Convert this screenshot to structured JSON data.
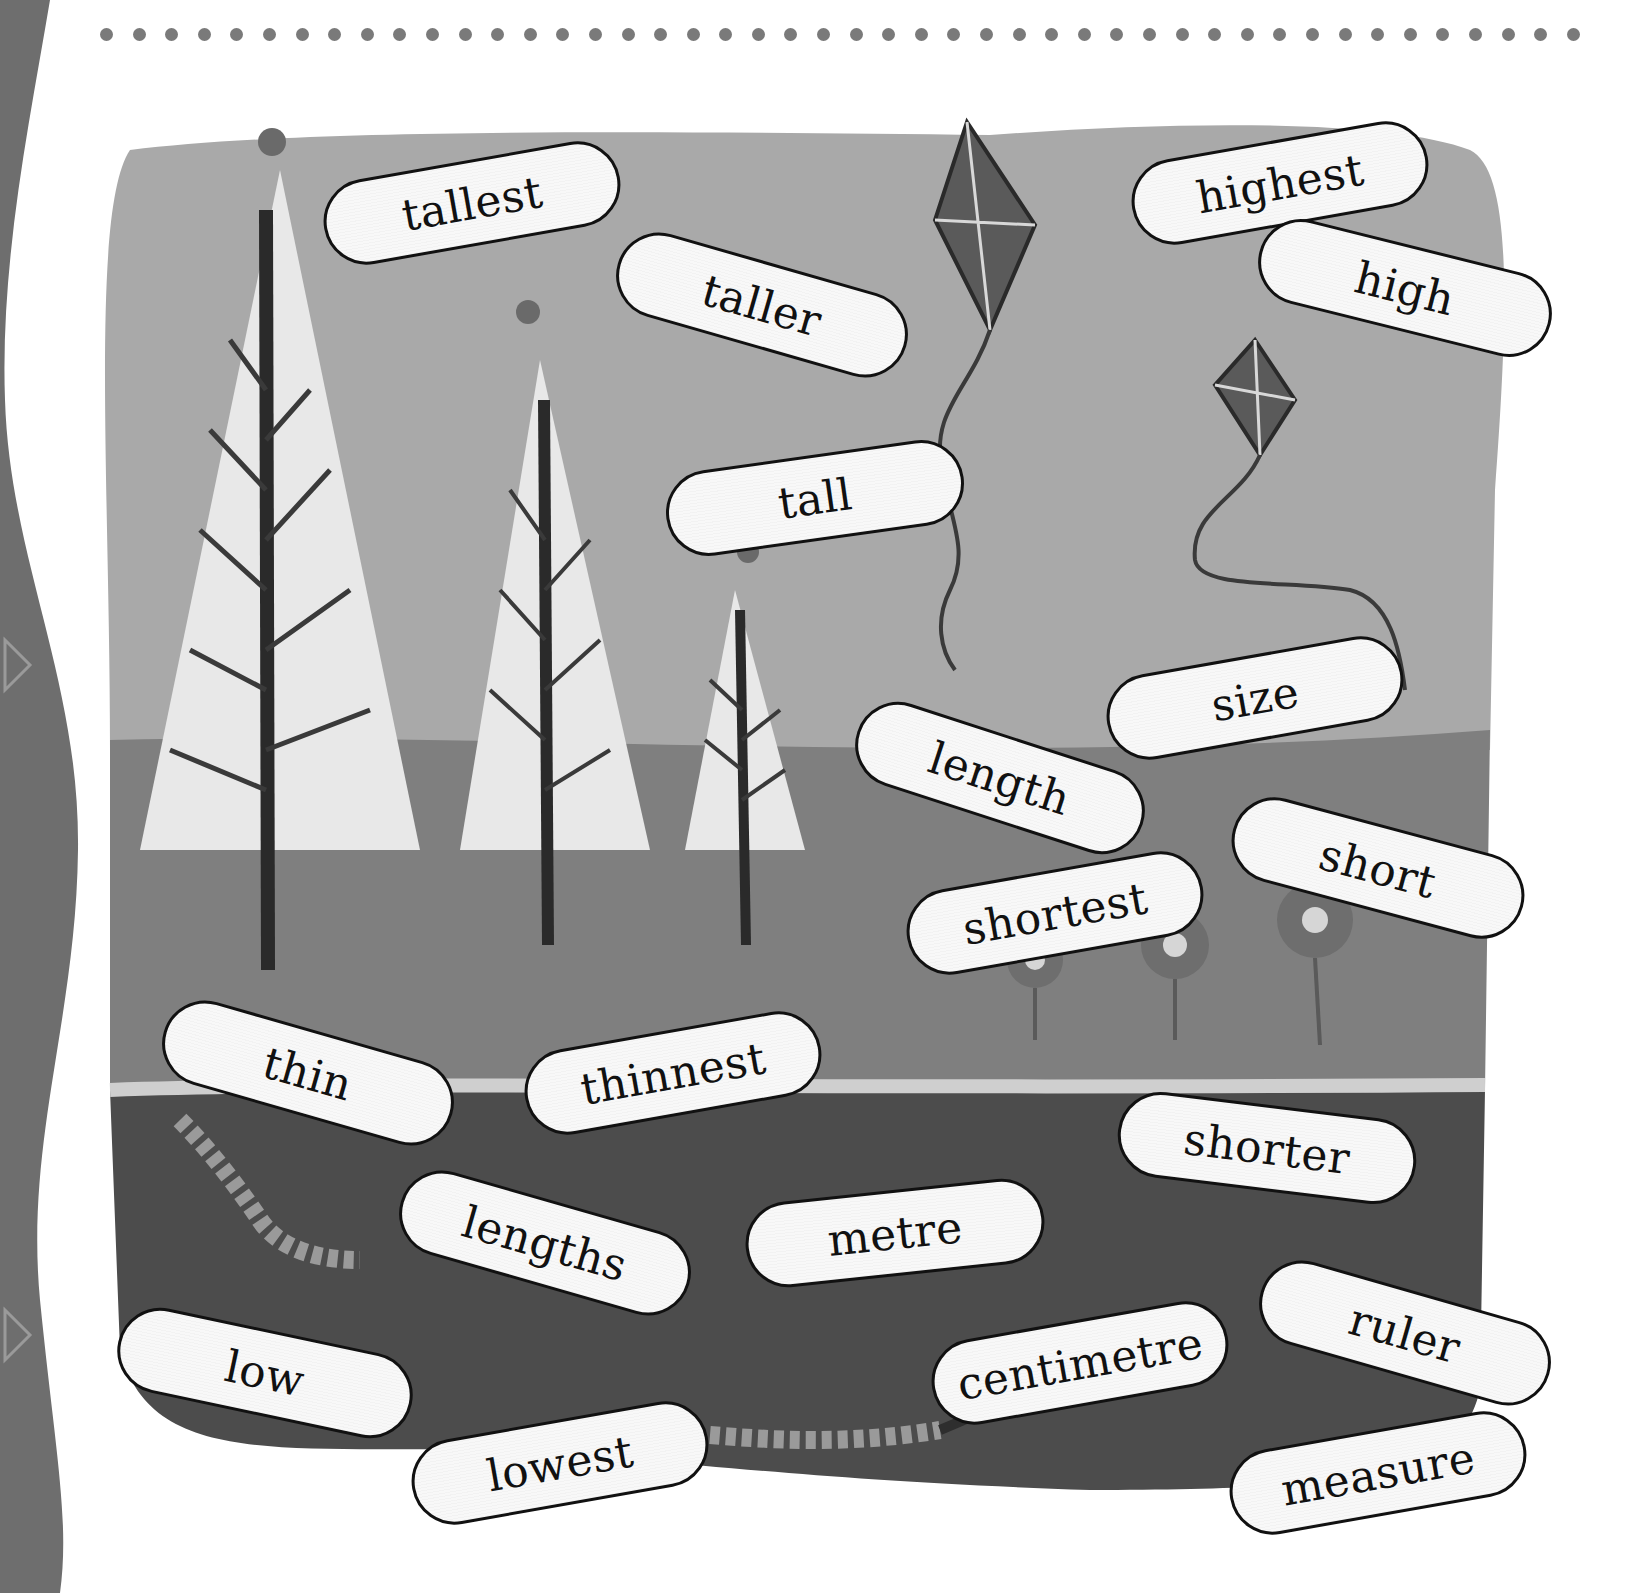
{
  "header": {
    "dot_count": 46,
    "dot_color": "#7a7a7a"
  },
  "scene": {
    "colors": {
      "sky": "#a9a9a9",
      "grass": "#7f7f7f",
      "soil": "#4c4c4c",
      "tree_glow": "#e8e8e8",
      "trunk": "#2a2a2a",
      "kite": "#5a5a5a",
      "border_strip": "#6e6e6e"
    },
    "illustrations": [
      "tall-tree",
      "medium-tree",
      "small-tree",
      "bird",
      "kite-high",
      "kite-low",
      "flowers",
      "worm-upper",
      "worm-lower",
      "ant"
    ]
  },
  "words": [
    {
      "id": "tallest",
      "label": "tallest",
      "x": 322,
      "y": 160,
      "w": 300,
      "rot": -10
    },
    {
      "id": "taller",
      "label": "taller",
      "x": 612,
      "y": 262,
      "w": 300,
      "rot": 16
    },
    {
      "id": "tall",
      "label": "tall",
      "x": 665,
      "y": 455,
      "w": 300,
      "rot": -8
    },
    {
      "id": "highest",
      "label": "highest",
      "x": 1130,
      "y": 140,
      "w": 300,
      "rot": -10
    },
    {
      "id": "high",
      "label": "high",
      "x": 1255,
      "y": 245,
      "w": 300,
      "rot": 14
    },
    {
      "id": "size",
      "label": "size",
      "x": 1105,
      "y": 655,
      "w": 300,
      "rot": -10
    },
    {
      "id": "length",
      "label": "length",
      "x": 850,
      "y": 735,
      "w": 300,
      "rot": 18
    },
    {
      "id": "short",
      "label": "short",
      "x": 1228,
      "y": 825,
      "w": 300,
      "rot": 15
    },
    {
      "id": "shortest",
      "label": "shortest",
      "x": 905,
      "y": 870,
      "w": 300,
      "rot": -10
    },
    {
      "id": "thin",
      "label": "thin",
      "x": 158,
      "y": 1030,
      "w": 300,
      "rot": 16
    },
    {
      "id": "thinnest",
      "label": "thinnest",
      "x": 523,
      "y": 1030,
      "w": 300,
      "rot": -10
    },
    {
      "id": "shorter",
      "label": "shorter",
      "x": 1117,
      "y": 1105,
      "w": 300,
      "rot": 7
    },
    {
      "id": "lengths",
      "label": "lengths",
      "x": 395,
      "y": 1200,
      "w": 300,
      "rot": 16
    },
    {
      "id": "metre",
      "label": "metre",
      "x": 745,
      "y": 1190,
      "w": 300,
      "rot": -6
    },
    {
      "id": "ruler",
      "label": "ruler",
      "x": 1255,
      "y": 1290,
      "w": 300,
      "rot": 16
    },
    {
      "id": "centimetre",
      "label": "centimetre",
      "x": 930,
      "y": 1320,
      "w": 300,
      "rot": -10
    },
    {
      "id": "low",
      "label": "low",
      "x": 115,
      "y": 1330,
      "w": 300,
      "rot": 12
    },
    {
      "id": "lowest",
      "label": "lowest",
      "x": 410,
      "y": 1420,
      "w": 300,
      "rot": -10
    },
    {
      "id": "measure",
      "label": "measure",
      "x": 1228,
      "y": 1430,
      "w": 300,
      "rot": -10
    }
  ]
}
